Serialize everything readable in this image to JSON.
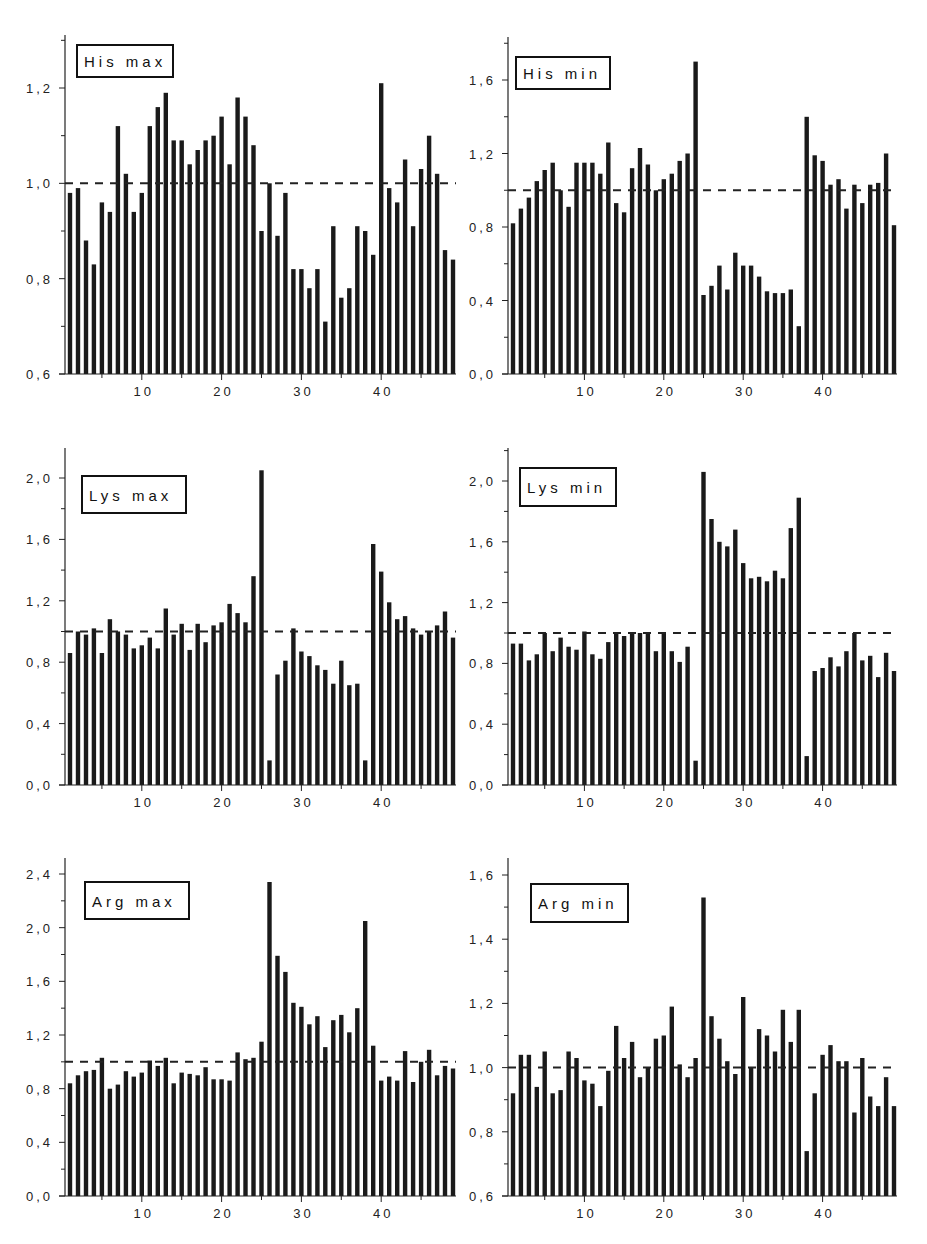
{
  "page_header": {
    "left": "",
    "center": ""
  },
  "chart_data": [
    {
      "type": "bar",
      "title": "His max",
      "xlabel": "",
      "ylabel": "",
      "x": [
        1,
        2,
        3,
        4,
        5,
        6,
        7,
        8,
        9,
        10,
        11,
        12,
        13,
        14,
        15,
        16,
        17,
        18,
        19,
        20,
        21,
        22,
        23,
        24,
        25,
        26,
        27,
        28,
        29,
        30,
        31,
        32,
        33,
        34,
        35,
        36,
        37,
        38,
        39,
        40,
        41,
        42,
        43,
        44,
        45,
        46,
        47,
        48
      ],
      "values": [
        0.98,
        0.99,
        0.88,
        0.83,
        0.96,
        0.94,
        1.12,
        1.02,
        0.94,
        0.98,
        1.12,
        1.16,
        1.19,
        1.09,
        1.09,
        1.04,
        1.07,
        1.09,
        1.1,
        1.14,
        1.04,
        1.18,
        1.14,
        1.08,
        0.9,
        1.0,
        0.89,
        0.98,
        0.82,
        0.82,
        0.78,
        0.82,
        0.71,
        0.91,
        0.76,
        0.78,
        0.91,
        0.9,
        0.85,
        1.21,
        0.99,
        0.96,
        1.05,
        0.91,
        1.03,
        1.1,
        1.02,
        0.86,
        0.84
      ],
      "reference_line": 1.0,
      "ylim": [
        0.6,
        1.32
      ],
      "yticks": [
        "0,6",
        "0,8",
        "1,0",
        "1,2"
      ],
      "ytick_values": [
        0.6,
        0.8,
        1.0,
        1.2
      ],
      "xticks": [
        "10",
        "20",
        "30",
        "40"
      ],
      "grid": false,
      "legend_position": "top-left"
    },
    {
      "type": "bar",
      "title": "His min",
      "xlabel": "",
      "ylabel": "",
      "values": [
        0.82,
        0.9,
        0.96,
        1.05,
        1.11,
        1.15,
        1.0,
        0.91,
        1.15,
        1.15,
        1.15,
        1.09,
        1.26,
        0.93,
        0.88,
        1.12,
        1.23,
        1.14,
        1.0,
        1.06,
        1.09,
        1.16,
        1.2,
        1.7,
        0.43,
        0.48,
        0.59,
        0.46,
        0.66,
        0.59,
        0.59,
        0.53,
        0.45,
        0.44,
        0.44,
        0.46,
        0.26,
        1.4,
        1.19,
        1.16,
        1.03,
        1.06,
        0.9,
        1.03,
        0.93,
        1.03,
        1.04,
        1.2,
        0.81
      ],
      "reference_line": 1.0,
      "ylim": [
        0.0,
        1.8
      ],
      "yticks": [
        "0,0",
        "0,4",
        "0,8",
        "1,2",
        "1,6"
      ],
      "ytick_values": [
        0.0,
        0.4,
        0.8,
        1.2,
        1.6
      ],
      "xticks": [
        "10",
        "20",
        "30",
        "40"
      ],
      "grid": false,
      "legend_position": "top-left"
    },
    {
      "type": "bar",
      "title": "Lys max",
      "xlabel": "",
      "ylabel": "",
      "values": [
        0.86,
        1.0,
        0.98,
        1.02,
        0.86,
        1.08,
        1.0,
        0.98,
        0.89,
        0.91,
        0.96,
        0.89,
        1.15,
        0.98,
        1.05,
        0.88,
        1.05,
        0.93,
        1.04,
        1.06,
        1.18,
        1.12,
        1.06,
        1.36,
        2.05,
        0.16,
        0.72,
        0.81,
        1.02,
        0.87,
        0.84,
        0.78,
        0.75,
        0.66,
        0.81,
        0.65,
        0.66,
        0.16,
        1.57,
        1.39,
        1.19,
        1.08,
        1.1,
        1.02,
        0.98,
        1.0,
        1.04,
        1.13,
        0.96
      ],
      "reference_line": 1.0,
      "ylim": [
        0.0,
        2.2
      ],
      "yticks": [
        "0,0",
        "0,4",
        "0,8",
        "1,2",
        "1,6",
        "2,0"
      ],
      "ytick_values": [
        0.0,
        0.4,
        0.8,
        1.2,
        1.6,
        2.0
      ],
      "xticks": [
        "10",
        "20",
        "30",
        "40"
      ],
      "grid": false,
      "legend_position": "top-left"
    },
    {
      "type": "bar",
      "title": "Lys min",
      "xlabel": "",
      "ylabel": "",
      "values": [
        0.93,
        0.93,
        0.82,
        0.86,
        1.0,
        0.88,
        0.97,
        0.91,
        0.89,
        1.01,
        0.86,
        0.83,
        0.94,
        1.0,
        0.98,
        1.0,
        1.0,
        1.0,
        0.88,
        1.0,
        0.88,
        0.81,
        0.91,
        0.16,
        2.06,
        1.75,
        1.6,
        1.57,
        1.68,
        1.46,
        1.36,
        1.37,
        1.34,
        1.41,
        1.36,
        1.69,
        1.89,
        0.19,
        0.75,
        0.77,
        0.84,
        0.78,
        0.88,
        1.0,
        0.82,
        0.85,
        0.71,
        0.87,
        0.75
      ],
      "reference_line": 1.0,
      "ylim": [
        0.0,
        2.2
      ],
      "yticks": [
        "0,0",
        "0,4",
        "0,8",
        "1,2",
        "1,6",
        "2,0"
      ],
      "ytick_values": [
        0.0,
        0.4,
        0.8,
        1.2,
        1.6,
        2.0
      ],
      "xticks": [
        "10",
        "20",
        "30",
        "40"
      ],
      "grid": false,
      "legend_position": "top-left"
    },
    {
      "type": "bar",
      "title": "Arg max",
      "xlabel": "",
      "ylabel": "",
      "values": [
        0.84,
        0.9,
        0.93,
        0.94,
        1.03,
        0.8,
        0.83,
        0.93,
        0.89,
        0.92,
        1.01,
        0.97,
        1.03,
        0.84,
        0.92,
        0.91,
        0.9,
        0.96,
        0.87,
        0.87,
        0.86,
        1.07,
        1.02,
        1.03,
        1.15,
        2.34,
        1.79,
        1.67,
        1.44,
        1.41,
        1.28,
        1.34,
        1.11,
        1.31,
        1.35,
        1.22,
        1.4,
        2.05,
        1.12,
        0.86,
        0.89,
        0.86,
        1.08,
        0.85,
        1.0,
        1.09,
        0.9,
        0.97,
        0.95
      ],
      "reference_line": 1.0,
      "ylim": [
        0.0,
        2.5
      ],
      "yticks": [
        "0,0",
        "0,4",
        "0,8",
        "1,2",
        "1,6",
        "2,0",
        "2,4"
      ],
      "ytick_values": [
        0.0,
        0.4,
        0.8,
        1.2,
        1.6,
        2.0,
        2.4
      ],
      "xticks": [
        "10",
        "20",
        "30",
        "40"
      ],
      "grid": false,
      "legend_position": "top-left"
    },
    {
      "type": "bar",
      "title": "Arg min",
      "xlabel": "",
      "ylabel": "",
      "values": [
        0.92,
        1.04,
        1.04,
        0.94,
        1.05,
        0.92,
        0.93,
        1.05,
        1.03,
        0.96,
        0.95,
        0.88,
        0.99,
        1.13,
        1.03,
        1.08,
        0.97,
        1.0,
        1.09,
        1.1,
        1.19,
        1.01,
        0.97,
        1.03,
        1.53,
        1.16,
        1.09,
        1.02,
        0.98,
        1.22,
        1.0,
        1.12,
        1.1,
        1.05,
        1.18,
        1.08,
        1.18,
        0.74,
        0.92,
        1.04,
        1.07,
        1.02,
        1.02,
        0.86,
        1.03,
        0.91,
        0.88,
        0.97,
        0.88
      ],
      "reference_line": 1.0,
      "ylim": [
        0.6,
        1.66
      ],
      "yticks": [
        "0,6",
        "0,8",
        "1,0",
        "1,2",
        "1,4",
        "1,6"
      ],
      "ytick_values": [
        0.6,
        0.8,
        1.0,
        1.2,
        1.4,
        1.6
      ],
      "xticks": [
        "10",
        "20",
        "30",
        "40"
      ],
      "grid": false,
      "legend_position": "top-left"
    }
  ],
  "layout": [
    {
      "left": 22,
      "top": 30,
      "axis_x": 65,
      "plot_w": 391,
      "base_y": 374,
      "top_val_y": 88,
      "top_val": 1.2,
      "base_val": 0.6,
      "axis_top": 35,
      "tick_minor": true,
      "legend": {
        "x": 77,
        "y": 45,
        "w": 96,
        "h": 32
      }
    },
    {
      "left": 470,
      "top": 30,
      "axis_x": 508,
      "plot_w": 389,
      "base_y": 374,
      "top_val_y": 80,
      "top_val": 1.6,
      "base_val": 0.0,
      "axis_top": 37,
      "tick_minor": true,
      "legend": {
        "x": 516,
        "y": 57,
        "w": 94,
        "h": 32
      }
    },
    {
      "left": 22,
      "top": 440,
      "axis_x": 65,
      "plot_w": 391,
      "base_y": 785,
      "top_val_y": 478,
      "top_val": 2.0,
      "base_val": 0.0,
      "axis_top": 448,
      "tick_minor": true,
      "legend": {
        "x": 82,
        "y": 476,
        "w": 104,
        "h": 37
      }
    },
    {
      "left": 470,
      "top": 440,
      "axis_x": 508,
      "plot_w": 389,
      "base_y": 785,
      "top_val_y": 481,
      "top_val": 2.0,
      "base_val": 0.0,
      "axis_top": 448,
      "tick_minor": true,
      "legend": {
        "x": 520,
        "y": 468,
        "w": 96,
        "h": 38
      }
    },
    {
      "left": 22,
      "top": 850,
      "axis_x": 65,
      "plot_w": 391,
      "base_y": 1196,
      "top_val_y": 874,
      "top_val": 2.4,
      "base_val": 0.0,
      "axis_top": 858,
      "tick_minor": true,
      "legend": {
        "x": 85,
        "y": 882,
        "w": 104,
        "h": 37
      }
    },
    {
      "left": 470,
      "top": 850,
      "axis_x": 508,
      "plot_w": 389,
      "base_y": 1196,
      "top_val_y": 875,
      "top_val": 1.6,
      "base_val": 0.6,
      "axis_top": 858,
      "tick_minor": true,
      "legend": {
        "x": 531,
        "y": 884,
        "w": 97,
        "h": 38
      }
    }
  ]
}
